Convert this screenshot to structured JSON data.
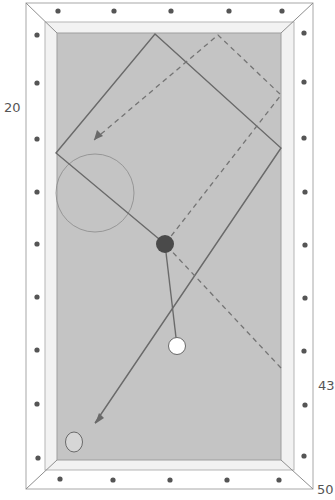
{
  "diagram": {
    "type": "billiards-shot-diagram",
    "labels": [
      {
        "text": "20",
        "x": 4,
        "y": 100
      },
      {
        "text": "43",
        "x": 318,
        "y": 378
      },
      {
        "text": "50",
        "x": 317,
        "y": 482
      }
    ],
    "colors": {
      "felt": "#c4c4c4",
      "rail": "#f4f4f4",
      "frame_stroke": "#9a9a9a",
      "diamond": "#555555",
      "line": "#6a6a6a",
      "object_ball": "#4a4a4a",
      "cue_ball": "#ffffff",
      "target_ball": "#d6d6d6"
    },
    "balls": [
      {
        "name": "object-ball",
        "cx": 165,
        "cy": 244
      },
      {
        "name": "cue-ball",
        "cx": 177,
        "cy": 346
      },
      {
        "name": "target-ball",
        "cx": 74,
        "cy": 442
      }
    ]
  }
}
